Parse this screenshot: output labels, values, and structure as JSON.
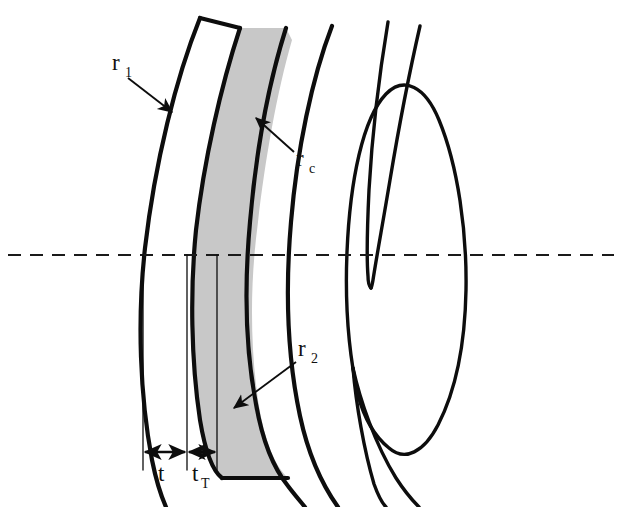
{
  "figure": {
    "background_color": "#ffffff",
    "ink_color": "#0d0d0d",
    "shaded_region_color": "#c8c8c8",
    "width": 622,
    "height": 507
  },
  "labels": {
    "r1": {
      "base": "r",
      "sub": "1",
      "x": 112,
      "y": 70
    },
    "rc": {
      "base": "r",
      "sub": "c",
      "x": 296,
      "y": 166
    },
    "r2": {
      "base": "r",
      "sub": "2",
      "x": 298,
      "y": 356
    },
    "t": {
      "base": "t",
      "sub": "",
      "x": 158,
      "y": 481
    },
    "tT": {
      "base": "t",
      "sub": "T",
      "x": 192,
      "y": 481
    }
  },
  "callouts": [
    {
      "name": "r1-leader",
      "label": "r1",
      "from_x": 128,
      "from_y": 78,
      "to_x": 172,
      "to_y": 112,
      "points_to": "anterior-contact-lens-surface"
    },
    {
      "name": "rc-leader",
      "label": "rc",
      "from_x": 294,
      "from_y": 152,
      "to_x": 258,
      "to_y": 120,
      "points_to": "anterior-cornea-surface"
    },
    {
      "name": "r2-leader",
      "label": "r2",
      "from_x": 296,
      "from_y": 362,
      "to_x": 236,
      "to_y": 406,
      "points_to": "posterior-contact-lens-surface"
    }
  ],
  "dimensions": [
    {
      "name": "lens-thickness",
      "label": "t",
      "x_start": 143,
      "x_end": 187,
      "y": 452,
      "description": "contact lens centre thickness"
    },
    {
      "name": "tear-film-thickness",
      "label": "tT",
      "x_start": 187,
      "x_end": 217,
      "y": 452,
      "description": "post-lens tear film thickness"
    }
  ],
  "optical_axis": {
    "name": "optical-axis",
    "style": "dashed",
    "y": 255,
    "x_start": 8,
    "x_end": 614
  },
  "surfaces": [
    {
      "name": "contact-lens-anterior",
      "vertex_x": 143,
      "label": "r1"
    },
    {
      "name": "contact-lens-posterior",
      "vertex_x": 187,
      "label": "r2"
    },
    {
      "name": "cornea-anterior",
      "vertex_x": 217,
      "label": "rc"
    },
    {
      "name": "cornea-posterior",
      "vertex_x": 247,
      "label": ""
    }
  ],
  "anatomy": [
    {
      "name": "contact-lens",
      "shaded": false
    },
    {
      "name": "tear-film-and-cornea-shaded-band",
      "shaded": true
    },
    {
      "name": "iris-upper",
      "shaded": false
    },
    {
      "name": "iris-lower",
      "shaded": false
    },
    {
      "name": "crystalline-lens",
      "shaded": false
    }
  ]
}
